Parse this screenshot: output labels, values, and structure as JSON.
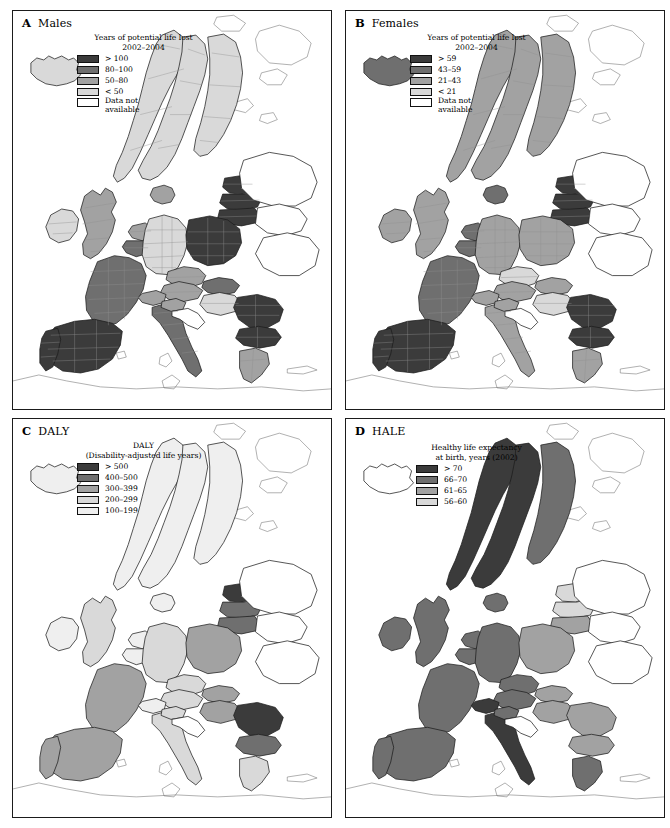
{
  "figure": {
    "kind": "four-panel choropleth map series of Europe",
    "region": "Europe"
  },
  "palette": {
    "c1_darkest": "#3b3b3b",
    "c2_dark": "#6f6f6f",
    "c3_mid": "#a2a2a2",
    "c4_light": "#d9d9d9",
    "c5_lightest": "#efefef",
    "no_data": "#ffffff",
    "border_national": "#1d1d1d",
    "border_sub": "#8e8e8e",
    "coastline": "#6e6e6e"
  },
  "panels": [
    {
      "id": "a",
      "letter": "A",
      "title": "Males",
      "legend_title": "Years of potential life lost\n2002–2004",
      "classes": [
        {
          "label": "> 100",
          "color": "#3b3b3b"
        },
        {
          "label": "80–100",
          "color": "#6f6f6f"
        },
        {
          "label": "50–80",
          "color": "#a2a2a2"
        },
        {
          "label": "< 50",
          "color": "#d9d9d9"
        },
        {
          "label": "Data not\navailable",
          "color": "#ffffff"
        }
      ]
    },
    {
      "id": "b",
      "letter": "B",
      "title": "Females",
      "legend_title": "Years of potential life lost\n2002–2004",
      "classes": [
        {
          "label": "> 59",
          "color": "#3b3b3b"
        },
        {
          "label": "43–59",
          "color": "#6f6f6f"
        },
        {
          "label": "21–43",
          "color": "#a2a2a2"
        },
        {
          "label": "< 21",
          "color": "#d9d9d9"
        },
        {
          "label": "Data not\navailable",
          "color": "#ffffff"
        }
      ]
    },
    {
      "id": "c",
      "letter": "C",
      "title": "DALY",
      "legend_title": "DALY\n(Disability-adjusted life years)",
      "classes": [
        {
          "label": "> 500",
          "color": "#3b3b3b"
        },
        {
          "label": "400–500",
          "color": "#6f6f6f"
        },
        {
          "label": "300–399",
          "color": "#a2a2a2"
        },
        {
          "label": "200–299",
          "color": "#d9d9d9"
        },
        {
          "label": "100–199",
          "color": "#efefef"
        }
      ]
    },
    {
      "id": "d",
      "letter": "D",
      "title": "HALE",
      "legend_title": "Healthy life expectancy\nat birth, years (2002)",
      "classes": [
        {
          "label": "> 70",
          "color": "#3b3b3b"
        },
        {
          "label": "66–70",
          "color": "#6f6f6f"
        },
        {
          "label": "61–65",
          "color": "#a2a2a2"
        },
        {
          "label": "56–60",
          "color": "#d9d9d9"
        }
      ]
    }
  ],
  "chart_data": {
    "type": "heatmap",
    "subtype": "choropleth map, 4 panels",
    "legend_position": "inside panel, top-left",
    "panel_a": {
      "title": "A Males",
      "variable": "Years of potential life lost 2002-2004",
      "unit": "years",
      "resolution": "sub-national (NUTS regions)",
      "bins": [
        "> 100",
        "80-100",
        "50-80",
        "< 50",
        "Data not available"
      ],
      "areas": [
        {
          "name": "Iceland",
          "class": "< 50"
        },
        {
          "name": "Norway",
          "class": "< 50"
        },
        {
          "name": "Sweden",
          "class": "< 50"
        },
        {
          "name": "Finland",
          "class": "< 50"
        },
        {
          "name": "Denmark",
          "class": "50-80"
        },
        {
          "name": "Estonia",
          "class": "> 100"
        },
        {
          "name": "Latvia",
          "class": "> 100"
        },
        {
          "name": "Lithuania",
          "class": "> 100"
        },
        {
          "name": "Ireland",
          "class": "< 50"
        },
        {
          "name": "United Kingdom",
          "class": "50-80"
        },
        {
          "name": "Scotland",
          "class": "80-100"
        },
        {
          "name": "Netherlands",
          "class": "50-80"
        },
        {
          "name": "Belgium",
          "class": "80-100"
        },
        {
          "name": "Germany",
          "class": "< 50"
        },
        {
          "name": "Poland",
          "class": "> 100"
        },
        {
          "name": "Czech Republic",
          "class": "50-80"
        },
        {
          "name": "Slovakia",
          "class": "80-100"
        },
        {
          "name": "Austria",
          "class": "50-80"
        },
        {
          "name": "Hungary",
          "class": "< 50"
        },
        {
          "name": "France",
          "class": "80-100"
        },
        {
          "name": "Switzerland",
          "class": "50-80"
        },
        {
          "name": "Italy",
          "class": "80-100"
        },
        {
          "name": "Spain",
          "class": "> 100"
        },
        {
          "name": "Portugal",
          "class": "> 100"
        },
        {
          "name": "Slovenia",
          "class": "50-80"
        },
        {
          "name": "Croatia",
          "class": "Data not available"
        },
        {
          "name": "Romania",
          "class": "> 100"
        },
        {
          "name": "Bulgaria",
          "class": "> 100"
        },
        {
          "name": "Greece",
          "class": "50-80"
        },
        {
          "name": "Russia",
          "class": "Data not available"
        },
        {
          "name": "Belarus",
          "class": "Data not available"
        },
        {
          "name": "Ukraine",
          "class": "Data not available"
        }
      ]
    },
    "panel_b": {
      "title": "B Females",
      "variable": "Years of potential life lost 2002-2004",
      "unit": "years",
      "resolution": "sub-national (NUTS regions)",
      "bins": [
        "> 59",
        "43-59",
        "21-43",
        "< 21",
        "Data not available"
      ],
      "areas": [
        {
          "name": "Iceland",
          "class": "43-59"
        },
        {
          "name": "Norway",
          "class": "21-43"
        },
        {
          "name": "Sweden",
          "class": "21-43"
        },
        {
          "name": "Finland",
          "class": "21-43"
        },
        {
          "name": "Denmark",
          "class": "43-59"
        },
        {
          "name": "Estonia",
          "class": "> 59"
        },
        {
          "name": "Latvia",
          "class": "> 59"
        },
        {
          "name": "Lithuania",
          "class": "> 59"
        },
        {
          "name": "Ireland",
          "class": "21-43"
        },
        {
          "name": "United Kingdom",
          "class": "21-43"
        },
        {
          "name": "Scotland",
          "class": "43-59"
        },
        {
          "name": "Netherlands",
          "class": "43-59"
        },
        {
          "name": "Belgium",
          "class": "43-59"
        },
        {
          "name": "Germany",
          "class": "21-43"
        },
        {
          "name": "Poland",
          "class": "21-43"
        },
        {
          "name": "Czech Republic",
          "class": "< 21"
        },
        {
          "name": "Slovakia",
          "class": "21-43"
        },
        {
          "name": "Austria",
          "class": "21-43"
        },
        {
          "name": "Hungary",
          "class": "< 21"
        },
        {
          "name": "France",
          "class": "43-59"
        },
        {
          "name": "Switzerland",
          "class": "21-43"
        },
        {
          "name": "Italy",
          "class": "21-43"
        },
        {
          "name": "Spain",
          "class": "> 59"
        },
        {
          "name": "Portugal",
          "class": "> 59"
        },
        {
          "name": "Slovenia",
          "class": "21-43"
        },
        {
          "name": "Croatia",
          "class": "Data not available"
        },
        {
          "name": "Romania",
          "class": "> 59"
        },
        {
          "name": "Bulgaria",
          "class": "> 59"
        },
        {
          "name": "Greece",
          "class": "21-43"
        },
        {
          "name": "Russia",
          "class": "Data not available"
        },
        {
          "name": "Belarus",
          "class": "Data not available"
        },
        {
          "name": "Ukraine",
          "class": "Data not available"
        }
      ]
    },
    "panel_c": {
      "title": "C DALY",
      "variable": "DALY (Disability-adjusted life years)",
      "unit": "DALY",
      "resolution": "national",
      "bins": [
        "> 500",
        "400-500",
        "300-399",
        "200-299",
        "100-199"
      ],
      "areas": [
        {
          "name": "Iceland",
          "class": "100-199"
        },
        {
          "name": "Norway",
          "class": "100-199"
        },
        {
          "name": "Sweden",
          "class": "100-199"
        },
        {
          "name": "Finland",
          "class": "100-199"
        },
        {
          "name": "Denmark",
          "class": "100-199"
        },
        {
          "name": "Estonia",
          "class": "> 500"
        },
        {
          "name": "Latvia",
          "class": "400-500"
        },
        {
          "name": "Lithuania",
          "class": "400-500"
        },
        {
          "name": "Ireland",
          "class": "100-199"
        },
        {
          "name": "United Kingdom",
          "class": "200-299"
        },
        {
          "name": "Netherlands",
          "class": "100-199"
        },
        {
          "name": "Belgium",
          "class": "100-199"
        },
        {
          "name": "Germany",
          "class": "200-299"
        },
        {
          "name": "Poland",
          "class": "300-399"
        },
        {
          "name": "Czech Republic",
          "class": "200-299"
        },
        {
          "name": "Slovakia",
          "class": "300-399"
        },
        {
          "name": "Austria",
          "class": "200-299"
        },
        {
          "name": "Hungary",
          "class": "300-399"
        },
        {
          "name": "France",
          "class": "300-399"
        },
        {
          "name": "Switzerland",
          "class": "100-199"
        },
        {
          "name": "Italy",
          "class": "200-299"
        },
        {
          "name": "Spain",
          "class": "300-399"
        },
        {
          "name": "Portugal",
          "class": "300-399"
        },
        {
          "name": "Slovenia",
          "class": "200-299"
        },
        {
          "name": "Croatia",
          "class": "Data not available"
        },
        {
          "name": "Romania",
          "class": "> 500"
        },
        {
          "name": "Bulgaria",
          "class": "400-500"
        },
        {
          "name": "Greece",
          "class": "200-299"
        },
        {
          "name": "Russia",
          "class": "Data not available"
        },
        {
          "name": "Belarus",
          "class": "Data not available"
        },
        {
          "name": "Ukraine",
          "class": "Data not available"
        }
      ]
    },
    "panel_d": {
      "title": "D HALE",
      "variable": "Healthy life expectancy at birth, years (2002)",
      "unit": "years",
      "resolution": "national",
      "bins": [
        "> 70",
        "66-70",
        "61-65",
        "56-60"
      ],
      "areas": [
        {
          "name": "Iceland",
          "class": "Data not available"
        },
        {
          "name": "Norway",
          "class": "> 70"
        },
        {
          "name": "Sweden",
          "class": "> 70"
        },
        {
          "name": "Finland",
          "class": "66-70"
        },
        {
          "name": "Denmark",
          "class": "66-70"
        },
        {
          "name": "Estonia",
          "class": "56-60"
        },
        {
          "name": "Latvia",
          "class": "56-60"
        },
        {
          "name": "Lithuania",
          "class": "61-65"
        },
        {
          "name": "Ireland",
          "class": "66-70"
        },
        {
          "name": "United Kingdom",
          "class": "66-70"
        },
        {
          "name": "Netherlands",
          "class": "66-70"
        },
        {
          "name": "Belgium",
          "class": "66-70"
        },
        {
          "name": "Germany",
          "class": "66-70"
        },
        {
          "name": "Poland",
          "class": "61-65"
        },
        {
          "name": "Czech Republic",
          "class": "66-70"
        },
        {
          "name": "Slovakia",
          "class": "61-65"
        },
        {
          "name": "Austria",
          "class": "66-70"
        },
        {
          "name": "Hungary",
          "class": "61-65"
        },
        {
          "name": "France",
          "class": "66-70"
        },
        {
          "name": "Switzerland",
          "class": "> 70"
        },
        {
          "name": "Italy",
          "class": "> 70"
        },
        {
          "name": "Spain",
          "class": "66-70"
        },
        {
          "name": "Portugal",
          "class": "66-70"
        },
        {
          "name": "Slovenia",
          "class": "66-70"
        },
        {
          "name": "Croatia",
          "class": "Data not available"
        },
        {
          "name": "Romania",
          "class": "61-65"
        },
        {
          "name": "Bulgaria",
          "class": "61-65"
        },
        {
          "name": "Greece",
          "class": "66-70"
        },
        {
          "name": "Russia",
          "class": "Data not available"
        },
        {
          "name": "Belarus",
          "class": "Data not available"
        },
        {
          "name": "Ukraine",
          "class": "Data not available"
        }
      ]
    }
  }
}
